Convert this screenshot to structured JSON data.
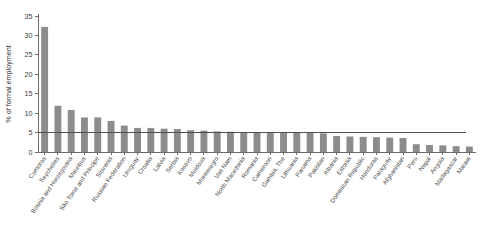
{
  "chart_data": {
    "type": "bar",
    "title": "",
    "subtitle": "",
    "xlabel": "",
    "ylabel": "% of formal employment",
    "ylim": [
      0,
      35
    ],
    "yticks": [
      0,
      5,
      10,
      15,
      20,
      25,
      30,
      35
    ],
    "ytick_labels": [
      "0",
      "5",
      "10",
      "15",
      "20",
      "25",
      "30",
      "35"
    ],
    "grid": false,
    "legend": null,
    "bar_color": "#8c8c8c",
    "reference_line": {
      "value": 5,
      "color": "#4f4f4f",
      "label": "",
      "extent_categories": 40
    },
    "categories": [
      "Comoros",
      "Seychelles",
      "Bosnia and Herzegovina",
      "Mauritius",
      "São Tomé and Príncipe",
      "Slovenia",
      "Russian Federation",
      "Uruguay",
      "Croatia",
      "Latvia",
      "Serbia",
      "Kosovo",
      "Moldova",
      "Montenegro",
      "Viet Nam",
      "North Macedonia",
      "Romania",
      "Cameroon",
      "Gambia, The",
      "Lithuania",
      "Panama",
      "Pakistan",
      "Albania",
      "Estonia",
      "Dominican Republic",
      "Honduras",
      "Paraguay",
      "Afghanistan",
      "Peru",
      "Nepal",
      "Angola",
      "Madagascar",
      "Malawi"
    ],
    "values": [
      32.2,
      11.9,
      10.8,
      8.9,
      8.9,
      8.0,
      6.8,
      6.2,
      6.2,
      6.0,
      5.9,
      5.6,
      5.5,
      5.3,
      5.2,
      5.1,
      5.1,
      5.0,
      5.0,
      4.9,
      4.9,
      4.8,
      4.1,
      4.0,
      3.9,
      3.8,
      3.7,
      3.6,
      2.0,
      1.8,
      1.7,
      1.5,
      1.4
    ]
  }
}
